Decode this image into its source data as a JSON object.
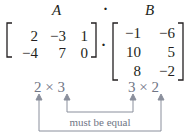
{
  "labels": {
    "A": "A",
    "dot": "·",
    "B": "B"
  },
  "matrix_a": {
    "rows": [
      [
        "2",
        "-3",
        "1"
      ],
      [
        "-4",
        "7",
        "0"
      ]
    ]
  },
  "matrix_b": {
    "rows": [
      [
        "-1",
        "-6"
      ],
      [
        "10",
        "5"
      ],
      [
        "8",
        "-2"
      ]
    ]
  },
  "multiply_symbol": "·",
  "dims": {
    "a": {
      "rows": "2",
      "times": "×",
      "cols": "3"
    },
    "b": {
      "rows": "3",
      "times": "×",
      "cols": "2"
    }
  },
  "annotation": "must be equal",
  "colors": {
    "text": "#231f20",
    "annotation": "#6f7585"
  }
}
